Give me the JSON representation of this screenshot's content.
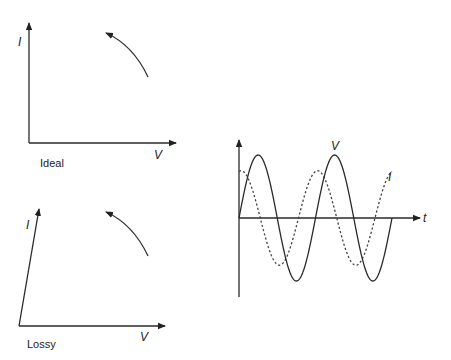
{
  "panels": {
    "ideal": {
      "caption": "Ideal",
      "x_axis_label": "V",
      "y_axis_label": "I",
      "axis_style": "orthogonal"
    },
    "lossy": {
      "caption": "Lossy",
      "x_axis_label": "V",
      "y_axis_label": "I",
      "axis_style": "skewed"
    },
    "waveform": {
      "x_axis_label": "t",
      "series": [
        {
          "name": "V",
          "label": "V",
          "style": "solid",
          "amplitude": 1.0,
          "phase_deg": 0,
          "cycles": 2
        },
        {
          "name": "I",
          "label": "I",
          "style": "dashed",
          "amplitude": 0.75,
          "phase_deg": 80,
          "cycles": 2
        }
      ]
    }
  }
}
